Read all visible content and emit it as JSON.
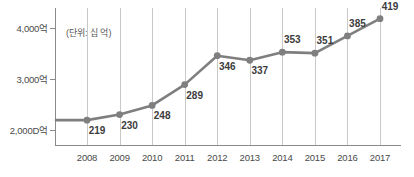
{
  "chart_data": {
    "type": "line",
    "title": "",
    "subtitle": "",
    "unit_note": "(단위: 십 억)",
    "xlabel": "",
    "ylabel": "",
    "categories": [
      "2008",
      "2009",
      "2010",
      "2011",
      "2012",
      "2013",
      "2014",
      "2015",
      "2016",
      "2017"
    ],
    "values": [
      219,
      230,
      248,
      289,
      346,
      337,
      353,
      351,
      385,
      419
    ],
    "series": [
      {
        "name": "",
        "values": [
          219,
          230,
          248,
          289,
          346,
          337,
          353,
          351,
          385,
          419
        ]
      }
    ],
    "y_tick_labels": [
      "4,000억",
      "3,000억",
      "2,000D억"
    ],
    "y_tick_values": [
      400,
      300,
      200
    ],
    "ylim": [
      170,
      440
    ],
    "grid": "vertical",
    "legend": "none",
    "line_color": "#7f7f7f",
    "marker_color": "#7f7f7f",
    "gridline_color": "#c9c9c9",
    "axis_color": "#8a8a8a",
    "label_color": "#3c3c3c"
  },
  "axis": {
    "y_ticks": [
      {
        "label": "4,000억",
        "value": 400
      },
      {
        "label": "3,000억",
        "value": 300
      },
      {
        "label": "2,000D억",
        "value": 200
      }
    ],
    "x_ticks": [
      {
        "label": "2008"
      },
      {
        "label": "2009"
      },
      {
        "label": "2010"
      },
      {
        "label": "2011"
      },
      {
        "label": "2012"
      },
      {
        "label": "2013"
      },
      {
        "label": "2014"
      },
      {
        "label": "2015"
      },
      {
        "label": "2016"
      },
      {
        "label": "2017"
      }
    ]
  },
  "annotations": {
    "unit": "(단위: 십 억)"
  },
  "point_labels": [
    "219",
    "230",
    "248",
    "289",
    "346",
    "337",
    "353",
    "351",
    "385",
    "419"
  ]
}
